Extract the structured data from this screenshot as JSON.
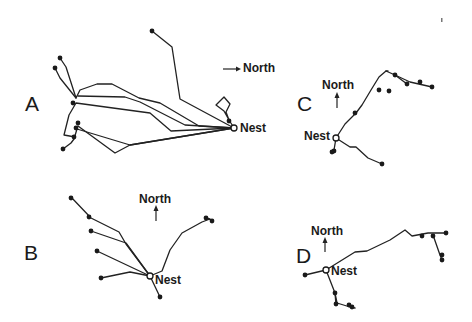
{
  "figure": {
    "panels": [
      {
        "id": "A",
        "letter": "A",
        "north_label": "North",
        "north_direction": "right",
        "nest_label": "Nest",
        "nest": [
          234,
          128
        ],
        "paths": [
          "M234,128 L180,99 L172,47 L152,31",
          "M234,128 L229,120 L226,112 L230,104 L224,97 L216,105 L224,111 L229,120",
          "M234,128 L199,126 L160,103 L139,98 L112,84 L97,84 L80,90 L76,98 L66,67 L60,58",
          "M234,128 L185,125 L140,102 L125,97 L78,96",
          "M234,128 L171,131 L150,113 L76,103 L69,115 L64,135 L75,137",
          "M234,128 L130,145 L115,153 L78,126",
          "M234,128 L130,145 L77,129 L74,139 L71,143 L63,149",
          "M76,98 L60,78 L55,68"
        ],
        "dots": [
          [
            152,
            31
          ],
          [
            60,
            58
          ],
          [
            55,
            68
          ],
          [
            73,
            103
          ],
          [
            78,
            123
          ],
          [
            76,
            128
          ],
          [
            74,
            137
          ],
          [
            63,
            149
          ],
          [
            229,
            121
          ]
        ]
      },
      {
        "id": "B",
        "letter": "B",
        "north_label": "North",
        "north_direction": "up",
        "nest_label": "Nest",
        "nest": [
          150,
          276
        ],
        "paths": [
          "M150,276 L160,297",
          "M150,276 L126,244 L119,232 L91,218 L71,197",
          "M150,276 L126,243 L91,231",
          "M150,276 L97,251",
          "M150,276 L130,272 L101,278",
          "M150,276 L162,271 L170,250 L182,233 L202,222 L210,219 L206,218 L212,220"
        ],
        "dots": [
          [
            71,
            198
          ],
          [
            89,
            217
          ],
          [
            91,
            231
          ],
          [
            97,
            251
          ],
          [
            101,
            278
          ],
          [
            160,
            297
          ],
          [
            206,
            218
          ],
          [
            212,
            221
          ]
        ]
      },
      {
        "id": "C",
        "letter": "C",
        "north_label": "North",
        "north_direction": "up",
        "nest_label": "Nest",
        "nest": [
          336,
          138
        ],
        "paths": [
          "M336,138 L345,124 L356,113 L362,105 L371,90 L379,77 L386,71 L395,75 L410,82 L432,87",
          "M395,75 L407,84",
          "M386,71 L388,71",
          "M336,138 L350,147 L356,147 L368,158 L382,164",
          "M336,138 L334,150"
        ],
        "dots": [
          [
            355,
            113
          ],
          [
            379,
            90
          ],
          [
            389,
            91
          ],
          [
            395,
            75
          ],
          [
            407,
            84
          ],
          [
            420,
            82
          ],
          [
            432,
            87
          ],
          [
            382,
            164
          ],
          [
            334,
            151
          ],
          [
            332,
            152
          ]
        ]
      },
      {
        "id": "D",
        "letter": "D",
        "north_label": "North",
        "north_direction": "up",
        "nest_label": "Nest",
        "nest": [
          326,
          270
        ],
        "paths": [
          "M326,270 L355,252 L367,251 L390,240 L405,230 L412,236 L428,233 L446,233",
          "M326,270 L305,275",
          "M326,270 L335,293 L337,303 L350,307 L355,308",
          "M335,293 L336,305",
          "M433,235 L440,255 L442,260"
        ],
        "dots": [
          [
            305,
            275
          ],
          [
            335,
            293
          ],
          [
            336,
            304
          ],
          [
            349,
            305
          ],
          [
            352,
            307
          ],
          [
            422,
            236
          ],
          [
            433,
            236
          ],
          [
            446,
            233
          ],
          [
            442,
            255
          ],
          [
            442,
            260
          ]
        ]
      }
    ],
    "stray_mark": [
      441,
      20
    ]
  },
  "labels": {
    "A": {
      "letter": "A",
      "north": "North",
      "nest": "Nest"
    },
    "B": {
      "letter": "B",
      "north": "North",
      "nest": "Nest"
    },
    "C": {
      "letter": "C",
      "north": "North",
      "nest": "Nest"
    },
    "D": {
      "letter": "D",
      "north": "North",
      "nest": "Nest"
    }
  }
}
